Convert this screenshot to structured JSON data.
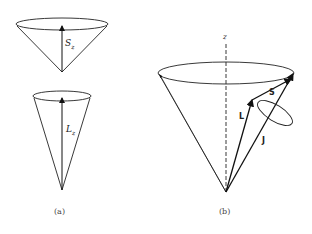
{
  "figure": {
    "panel_a": {
      "caption": "(a)",
      "upper_cone": {
        "vector_label": "S",
        "vector_subscript": "z"
      },
      "lower_cone": {
        "vector_label": "L",
        "vector_subscript": "z"
      }
    },
    "panel_b": {
      "caption": "(b)",
      "axis_label": "z",
      "vectors": {
        "L": "L",
        "S": "S",
        "J": "J"
      }
    }
  }
}
